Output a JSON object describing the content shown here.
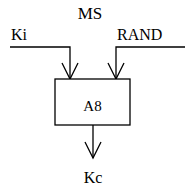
{
  "diagram": {
    "title": "MS",
    "inputs": [
      {
        "label": "Ki"
      },
      {
        "label": "RAND"
      }
    ],
    "block": {
      "label": "A8"
    },
    "output": {
      "label": "Kc"
    },
    "colors": {
      "stroke": "#000000",
      "background": "#ffffff"
    }
  }
}
